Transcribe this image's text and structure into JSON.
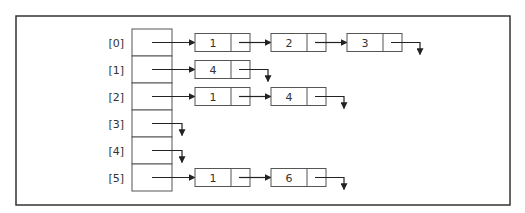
{
  "diagram": {
    "title": "",
    "type": "adjacency-list",
    "frame_color": "#333333",
    "line_color": "#222222",
    "box_stroke": "#555555",
    "text_color": "#333333",
    "rows": [
      {
        "index": "[0]",
        "nodes": [
          "1",
          "2",
          "3"
        ]
      },
      {
        "index": "[1]",
        "nodes": [
          "4"
        ]
      },
      {
        "index": "[2]",
        "nodes": [
          "1",
          "4"
        ]
      },
      {
        "index": "[3]",
        "nodes": []
      },
      {
        "index": "[4]",
        "nodes": []
      },
      {
        "index": "[5]",
        "nodes": [
          "1",
          "6"
        ]
      }
    ]
  }
}
